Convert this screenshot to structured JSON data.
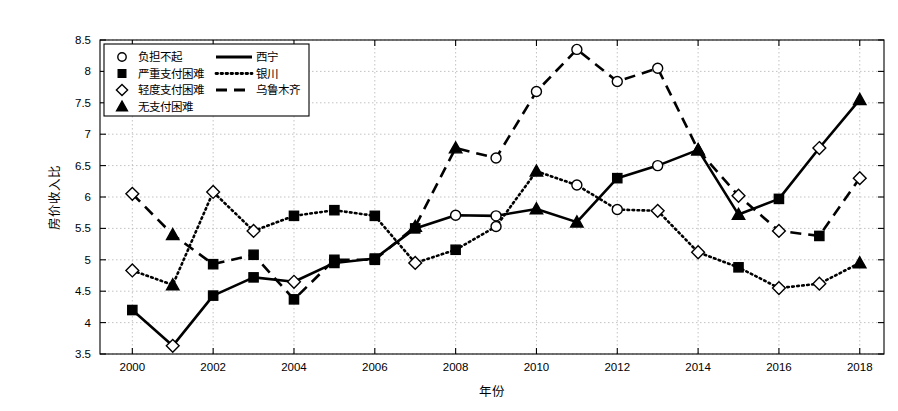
{
  "chart_data": {
    "type": "line",
    "title": "",
    "xlabel": "年份",
    "ylabel": "房价收入比",
    "xlim": [
      1999.2,
      2018.6
    ],
    "ylim": [
      3.5,
      8.5
    ],
    "xticks": [
      2000,
      2002,
      2004,
      2006,
      2008,
      2010,
      2012,
      2014,
      2016,
      2018
    ],
    "yticks": [
      3.5,
      4,
      4.5,
      5,
      5.5,
      6,
      6.5,
      7,
      7.5,
      8,
      8.5
    ],
    "grid": true,
    "legend_position": "upper-left",
    "x": [
      2000,
      2001,
      2002,
      2003,
      2004,
      2005,
      2006,
      2007,
      2008,
      2009,
      2010,
      2011,
      2012,
      2013,
      2014,
      2015,
      2016,
      2017,
      2018
    ],
    "series": [
      {
        "name": "西宁",
        "linestyle": "solid",
        "values": [
          4.2,
          3.63,
          4.43,
          4.72,
          4.65,
          4.95,
          5.02,
          5.5,
          5.71,
          5.7,
          5.81,
          5.6,
          6.3,
          6.5,
          6.75,
          5.72,
          5.97,
          6.78,
          7.55
        ],
        "markers": [
          "square",
          "diamond",
          "square",
          "square",
          "diamond",
          "square",
          "square",
          "square",
          "circle",
          "circle",
          "triangle",
          "triangle",
          "square",
          "circle",
          "triangle",
          "triangle",
          "square",
          "diamond",
          "triangle"
        ]
      },
      {
        "name": "银川",
        "linestyle": "dotted",
        "values": [
          4.83,
          4.6,
          6.08,
          5.46,
          5.7,
          5.79,
          5.7,
          4.95,
          5.16,
          5.53,
          6.41,
          6.19,
          5.8,
          5.78,
          5.12,
          4.88,
          4.55,
          4.62,
          4.95
        ],
        "markers": [
          "diamond",
          "triangle",
          "diamond",
          "diamond",
          "square",
          "square",
          "square",
          "diamond",
          "square",
          "circle",
          "triangle",
          "circle",
          "circle",
          "diamond",
          "diamond",
          "square",
          "diamond",
          "diamond",
          "triangle"
        ]
      },
      {
        "name": "乌鲁木齐",
        "linestyle": "dashed",
        "values": [
          6.05,
          5.4,
          4.93,
          5.08,
          4.37,
          5.0,
          5.0,
          5.53,
          6.78,
          6.62,
          7.68,
          8.35,
          7.84,
          8.05,
          6.75,
          6.02,
          5.46,
          5.38,
          6.3
        ],
        "markers": [
          "diamond",
          "triangle",
          "square",
          "square",
          "square",
          "square",
          "square",
          "triangle",
          "triangle",
          "circle",
          "circle",
          "circle",
          "circle",
          "circle",
          "triangle",
          "diamond",
          "diamond",
          "square",
          "diamond"
        ]
      }
    ]
  },
  "legend": {
    "marker_entries": [
      {
        "marker": "circle",
        "label": "负担不起"
      },
      {
        "marker": "square",
        "label": "严重支付困难"
      },
      {
        "marker": "diamond",
        "label": "轻度支付困难"
      },
      {
        "marker": "triangle",
        "label": "无支付困难"
      }
    ],
    "line_entries": [
      {
        "linestyle": "solid",
        "label": "西宁"
      },
      {
        "linestyle": "dotted",
        "label": "银川"
      },
      {
        "linestyle": "dashed",
        "label": "乌鲁木齐"
      }
    ]
  },
  "colors": {
    "line": "#000000",
    "grid": "#b4b4b4",
    "axis": "#000000",
    "background": "#ffffff",
    "marker_fill_open": "#ffffff",
    "marker_fill_closed": "#000000"
  }
}
